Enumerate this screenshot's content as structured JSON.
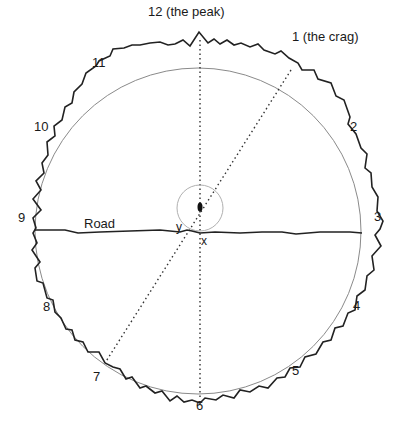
{
  "diagram": {
    "type": "hour-clock horizon diagram",
    "hour_labels": [
      {
        "id": "12",
        "text": "12 (the peak)",
        "x": 148,
        "y": 4
      },
      {
        "id": "1",
        "text": "1 (the crag)",
        "x": 292,
        "y": 29
      },
      {
        "id": "2",
        "text": "2",
        "x": 350,
        "y": 118
      },
      {
        "id": "3",
        "text": "3",
        "x": 373,
        "y": 210
      },
      {
        "id": "4",
        "text": "4",
        "x": 353,
        "y": 298
      },
      {
        "id": "5",
        "text": "5",
        "x": 292,
        "y": 363
      },
      {
        "id": "6",
        "text": "6",
        "x": 195,
        "y": 397
      },
      {
        "id": "7",
        "text": "7",
        "x": 92,
        "y": 369
      },
      {
        "id": "8",
        "text": "8",
        "x": 43,
        "y": 298
      },
      {
        "id": "9",
        "text": "9",
        "x": 17,
        "y": 210
      },
      {
        "id": "10",
        "text": "10",
        "x": 35,
        "y": 118
      },
      {
        "id": "11",
        "text": "11",
        "x": 92,
        "y": 55
      }
    ],
    "road_label": "Road",
    "point_labels": {
      "y": "y",
      "x": "x"
    },
    "colors": {
      "horizon": "#222222",
      "circle": "#888888",
      "dotted": "#333333",
      "road": "#222222",
      "small_circle": "#aaaaaa"
    }
  }
}
